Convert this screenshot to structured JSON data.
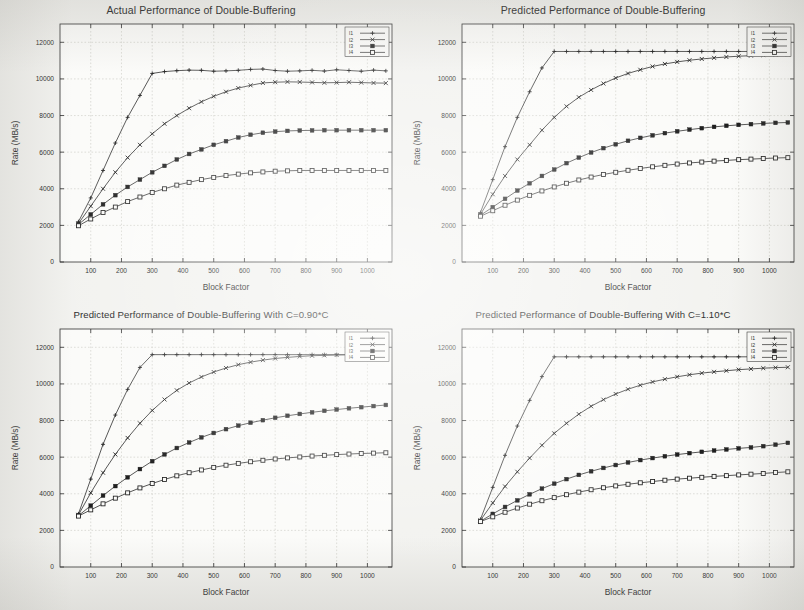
{
  "figure": {
    "panel_count": 4,
    "shared": {
      "xlabel": "Block Factor",
      "ylabel": "Rate (MB/s)",
      "xticks": [
        100,
        200,
        300,
        400,
        500,
        600,
        700,
        800,
        900,
        1000
      ],
      "yticks": [
        0,
        2000,
        4000,
        6000,
        8000,
        10000,
        12000
      ],
      "legend_labels": [
        "l1",
        "l2",
        "l3",
        "l4"
      ],
      "line_color": "#1f1f1f",
      "grid_color": "#b9b9b0",
      "axis_color": "#2a2a2a"
    }
  },
  "chart_data": [
    {
      "type": "line",
      "title": "Actual Performance of Double-Buffering",
      "xlabel": "Block Factor",
      "ylabel": "Rate (MB/s)",
      "xlim": [
        0,
        1080
      ],
      "ylim": [
        0,
        13000
      ],
      "xticks": [
        100,
        200,
        300,
        400,
        500,
        600,
        700,
        800,
        900,
        1000
      ],
      "yticks": [
        0,
        2000,
        4000,
        6000,
        8000,
        10000,
        12000
      ],
      "grid": true,
      "legend_position": "upper-right-inside",
      "x": [
        60,
        100,
        140,
        180,
        220,
        260,
        300,
        340,
        380,
        420,
        460,
        500,
        540,
        580,
        620,
        660,
        700,
        740,
        780,
        820,
        860,
        900,
        940,
        980,
        1020,
        1060
      ],
      "series": [
        {
          "name": "l1",
          "marker": "plus",
          "values": [
            2200,
            3500,
            5000,
            6500,
            7900,
            9100,
            10300,
            10400,
            10450,
            10480,
            10470,
            10420,
            10440,
            10470,
            10520,
            10540,
            10460,
            10420,
            10440,
            10470,
            10430,
            10500,
            10460,
            10420,
            10480,
            10440
          ]
        },
        {
          "name": "l2",
          "marker": "cross",
          "values": [
            2100,
            3050,
            4000,
            4900,
            5700,
            6400,
            7000,
            7550,
            8000,
            8400,
            8750,
            9050,
            9300,
            9500,
            9650,
            9780,
            9820,
            9840,
            9830,
            9810,
            9790,
            9800,
            9820,
            9800,
            9780,
            9770
          ]
        },
        {
          "name": "l3",
          "marker": "filled-square",
          "values": [
            2050,
            2600,
            3150,
            3650,
            4100,
            4500,
            4900,
            5250,
            5600,
            5900,
            6150,
            6400,
            6600,
            6800,
            6950,
            7060,
            7120,
            7160,
            7180,
            7190,
            7200,
            7200,
            7200,
            7200,
            7200,
            7200
          ]
        },
        {
          "name": "l4",
          "marker": "open-square",
          "values": [
            1980,
            2350,
            2700,
            3000,
            3300,
            3550,
            3800,
            4000,
            4200,
            4350,
            4500,
            4620,
            4720,
            4800,
            4870,
            4920,
            4960,
            4980,
            5000,
            5000,
            5000,
            5000,
            5000,
            5000,
            5000,
            5000
          ]
        }
      ]
    },
    {
      "type": "line",
      "title": "Predicted Performance of Double-Buffering",
      "xlabel": "Block Factor",
      "ylabel": "Rate (MB/s)",
      "xlim": [
        0,
        1080
      ],
      "ylim": [
        0,
        13000
      ],
      "xticks": [
        100,
        200,
        300,
        400,
        500,
        600,
        700,
        800,
        900,
        1000
      ],
      "yticks": [
        0,
        2000,
        4000,
        6000,
        8000,
        10000,
        12000
      ],
      "grid": true,
      "legend_position": "upper-right-inside",
      "x": [
        60,
        100,
        140,
        180,
        220,
        260,
        300,
        340,
        380,
        420,
        460,
        500,
        540,
        580,
        620,
        660,
        700,
        740,
        780,
        820,
        860,
        900,
        940,
        980,
        1020,
        1060
      ],
      "series": [
        {
          "name": "l1",
          "marker": "plus",
          "values": [
            2700,
            4500,
            6300,
            7900,
            9300,
            10600,
            11500,
            11500,
            11500,
            11500,
            11500,
            11500,
            11500,
            11500,
            11500,
            11500,
            11500,
            11500,
            11500,
            11500,
            11500,
            11500,
            11500,
            11500,
            11400,
            11350
          ]
        },
        {
          "name": "l2",
          "marker": "cross",
          "values": [
            2600,
            3700,
            4700,
            5600,
            6400,
            7200,
            7900,
            8500,
            9000,
            9400,
            9750,
            10050,
            10300,
            10500,
            10680,
            10820,
            10930,
            11020,
            11090,
            11150,
            11200,
            11240,
            11270,
            11300,
            11320,
            11330
          ]
        },
        {
          "name": "l3",
          "marker": "filled-square",
          "values": [
            2550,
            3000,
            3450,
            3900,
            4300,
            4700,
            5050,
            5400,
            5700,
            5980,
            6220,
            6430,
            6620,
            6780,
            6920,
            7040,
            7140,
            7230,
            7310,
            7380,
            7440,
            7490,
            7530,
            7570,
            7600,
            7620
          ]
        },
        {
          "name": "l4",
          "marker": "open-square",
          "values": [
            2500,
            2800,
            3100,
            3380,
            3640,
            3880,
            4100,
            4300,
            4480,
            4640,
            4780,
            4900,
            5010,
            5110,
            5200,
            5280,
            5350,
            5410,
            5460,
            5510,
            5550,
            5590,
            5620,
            5650,
            5680,
            5700
          ]
        }
      ]
    },
    {
      "type": "line",
      "title": "Predicted Performance of Double-Buffering With C=0.90*C",
      "xlabel": "Block Factor",
      "ylabel": "Rate (MB/s)",
      "xlim": [
        0,
        1080
      ],
      "ylim": [
        0,
        13000
      ],
      "xticks": [
        100,
        200,
        300,
        400,
        500,
        600,
        700,
        800,
        900,
        1000
      ],
      "yticks": [
        0,
        2000,
        4000,
        6000,
        8000,
        10000,
        12000
      ],
      "grid": true,
      "legend_position": "upper-right-inside",
      "x": [
        60,
        100,
        140,
        180,
        220,
        260,
        300,
        340,
        380,
        420,
        460,
        500,
        540,
        580,
        620,
        660,
        700,
        740,
        780,
        820,
        860,
        900,
        940,
        980,
        1020,
        1060
      ],
      "series": [
        {
          "name": "l1",
          "marker": "plus",
          "values": [
            2900,
            4800,
            6700,
            8300,
            9700,
            10900,
            11600,
            11600,
            11600,
            11600,
            11600,
            11600,
            11600,
            11600,
            11600,
            11600,
            11600,
            11600,
            11600,
            11600,
            11600,
            11600,
            11600,
            11600,
            11600,
            11600
          ]
        },
        {
          "name": "l2",
          "marker": "cross",
          "values": [
            2850,
            4050,
            5150,
            6150,
            7050,
            7850,
            8550,
            9150,
            9650,
            10050,
            10380,
            10650,
            10870,
            11050,
            11190,
            11300,
            11390,
            11450,
            11500,
            11540,
            11560,
            11580,
            11590,
            11600,
            11600,
            11600
          ]
        },
        {
          "name": "l3",
          "marker": "filled-square",
          "values": [
            2800,
            3350,
            3900,
            4420,
            4900,
            5350,
            5780,
            6150,
            6500,
            6800,
            7080,
            7320,
            7530,
            7720,
            7880,
            8020,
            8150,
            8260,
            8360,
            8450,
            8530,
            8600,
            8670,
            8730,
            8790,
            8850
          ]
        },
        {
          "name": "l4",
          "marker": "open-square",
          "values": [
            2780,
            3120,
            3450,
            3760,
            4050,
            4320,
            4560,
            4780,
            4980,
            5150,
            5300,
            5440,
            5560,
            5660,
            5750,
            5830,
            5900,
            5960,
            6010,
            6060,
            6100,
            6140,
            6170,
            6200,
            6220,
            6240
          ]
        }
      ]
    },
    {
      "type": "line",
      "title": "Predicted Performance of Double-Buffering With C=1.10*C",
      "xlabel": "Block Factor",
      "ylabel": "Rate (MB/s)",
      "xlim": [
        0,
        1080
      ],
      "ylim": [
        0,
        13000
      ],
      "xticks": [
        100,
        200,
        300,
        400,
        500,
        600,
        700,
        800,
        900,
        1000
      ],
      "yticks": [
        0,
        2000,
        4000,
        6000,
        8000,
        10000,
        12000
      ],
      "grid": true,
      "legend_position": "upper-right-inside",
      "x": [
        60,
        100,
        140,
        180,
        220,
        260,
        300,
        340,
        380,
        420,
        460,
        500,
        540,
        580,
        620,
        660,
        700,
        740,
        780,
        820,
        860,
        900,
        940,
        980,
        1020,
        1060
      ],
      "series": [
        {
          "name": "l1",
          "marker": "plus",
          "values": [
            2600,
            4350,
            6100,
            7700,
            9100,
            10400,
            11480,
            11480,
            11480,
            11480,
            11480,
            11480,
            11480,
            11480,
            11480,
            11480,
            11480,
            11480,
            11480,
            11480,
            11480,
            11480,
            11480,
            11480,
            11480,
            11480
          ]
        },
        {
          "name": "l2",
          "marker": "cross",
          "values": [
            2550,
            3500,
            4400,
            5200,
            5950,
            6650,
            7300,
            7850,
            8350,
            8780,
            9140,
            9450,
            9710,
            9930,
            10110,
            10260,
            10390,
            10500,
            10590,
            10660,
            10720,
            10780,
            10820,
            10860,
            10890,
            10910
          ]
        },
        {
          "name": "l3",
          "marker": "filled-square",
          "values": [
            2500,
            2900,
            3280,
            3640,
            3970,
            4280,
            4550,
            4800,
            5030,
            5230,
            5410,
            5570,
            5710,
            5840,
            5950,
            6050,
            6140,
            6220,
            6290,
            6360,
            6420,
            6480,
            6530,
            6600,
            6680,
            6780
          ]
        },
        {
          "name": "l4",
          "marker": "open-square",
          "values": [
            2480,
            2740,
            2990,
            3220,
            3430,
            3620,
            3790,
            3950,
            4090,
            4220,
            4330,
            4430,
            4520,
            4600,
            4670,
            4740,
            4800,
            4850,
            4900,
            4950,
            4990,
            5030,
            5070,
            5110,
            5160,
            5200
          ]
        }
      ]
    }
  ]
}
